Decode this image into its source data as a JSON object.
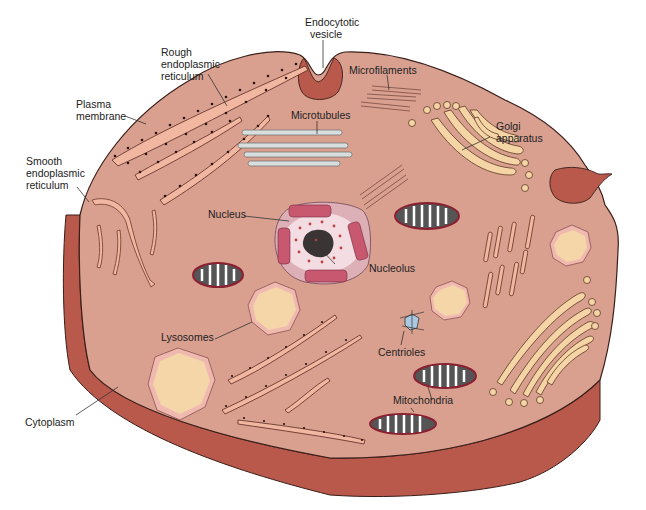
{
  "diagram": {
    "colors": {
      "background": "#ffffff",
      "cytoplasm": "#d9a090",
      "cell_edge": "#b8594c",
      "outline": "#3a1e18",
      "rough_er": "#f2b7a0",
      "golgi": "#f5d4a6",
      "lysosome_inner": "#f4d6a8",
      "lysosome_outer": "#f0b9b0",
      "mitochondria_fill": "#555555",
      "mitochondria_rim": "#8a2030",
      "nucleus_envelope": "#c75870",
      "nucleus_inner": "#f3dde3",
      "microtubules": "#d8dede"
    },
    "labels": {
      "endocytotic_vesicle": [
        "Endocytotic",
        "vesicle"
      ],
      "rough_er": [
        "Rough",
        "endoplasmic",
        "reticulum"
      ],
      "plasma_membrane": [
        "Plasma",
        "membrane"
      ],
      "smooth_er": [
        "Smooth",
        "endoplasmic",
        "reticulum"
      ],
      "microfilaments": "Microfilaments",
      "microtubules": "Microtubules",
      "golgi": [
        "Golgi",
        "apparatus"
      ],
      "nucleus": "Nucleus",
      "nucleolus": "Nucleolus",
      "lysosomes": "Lysosomes",
      "centrioles": "Centrioles",
      "mitochondria": "Mitochondria",
      "cytoplasm": "Cytoplasm"
    }
  }
}
